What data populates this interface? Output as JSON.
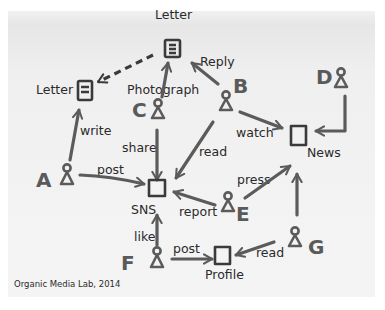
{
  "diagram": {
    "caption": "Organic Media Lab, 2014",
    "colors": {
      "stroke": "#5b5b5b",
      "text": "#2a2a2a",
      "panel": "#f0f0f0"
    },
    "actors": [
      {
        "id": "A",
        "letter": "A"
      },
      {
        "id": "B",
        "letter": "B"
      },
      {
        "id": "C",
        "letter": "C"
      },
      {
        "id": "D",
        "letter": "D"
      },
      {
        "id": "E",
        "letter": "E"
      },
      {
        "id": "F",
        "letter": "F"
      },
      {
        "id": "G",
        "letter": "G"
      }
    ],
    "objects": {
      "letter_top": "Letter",
      "letter_left": "Letter",
      "photograph": "Photograph",
      "sns": "SNS",
      "news": "News",
      "profile": "Profile"
    },
    "edges": {
      "a_write": "write",
      "a_post": "post",
      "c_share": "share",
      "b_reply": "Reply",
      "b_read": "read",
      "b_watch": "watch",
      "e_press": "press",
      "e_report": "report",
      "f_like": "like",
      "f_post": "post",
      "g_read": "read"
    }
  }
}
